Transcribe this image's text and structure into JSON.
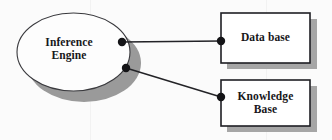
{
  "diagram": {
    "background_color": "#fbfbfb",
    "shadow_color": "#9a9a9a",
    "stroke_color": "#2a2a2e",
    "text_color": "#17171a",
    "nodes": [
      {
        "id": "inference-engine",
        "shape": "ellipse",
        "label": "Inference\nEngine",
        "lines": [
          "Inference",
          "Engine"
        ]
      },
      {
        "id": "data-base",
        "shape": "rectangle",
        "label": "Data base",
        "lines": [
          "Data base"
        ]
      },
      {
        "id": "knowledge-base",
        "shape": "rectangle",
        "label": "Knowledge\nBase",
        "lines": [
          "Knowledge",
          "Base"
        ]
      }
    ],
    "connectors": [
      {
        "id": "engine-to-database",
        "from": "inference-engine",
        "to": "data-base",
        "label": ""
      },
      {
        "id": "engine-to-knowledge",
        "from": "inference-engine",
        "to": "knowledge-base",
        "label": ""
      }
    ]
  }
}
